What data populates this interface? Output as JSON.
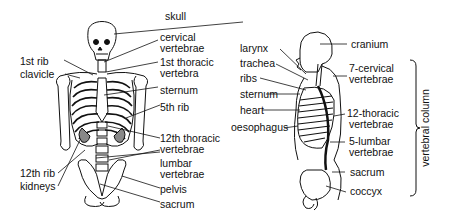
{
  "front_view": {
    "labels": {
      "skull": "skull",
      "cervical_1": "cervical",
      "cervical_2": "vertebrae",
      "first_thoracic_1": "1st thoracic",
      "first_thoracic_2": "vertebra",
      "first_rib": "1st rib",
      "clavicle": "clavicle",
      "sternum": "sternum",
      "fifth_rib": "5th rib",
      "twelfth_thoracic_1": "12th thoracic",
      "twelfth_thoracic_2": "vertebrae",
      "lumbar_1": "lumbar",
      "lumbar_2": "vertebrae",
      "twelfth_rib": "12th rib",
      "kidneys": "kidneys",
      "pelvis": "pelvis",
      "sacrum": "sacrum"
    }
  },
  "side_view": {
    "labels": {
      "cranium": "cranium",
      "larynx": "larynx",
      "trachea": "trachea",
      "ribs": "ribs",
      "sternum": "sternum",
      "heart": "heart",
      "oesophagus": "oesophagus",
      "cervical_1": "7-cervical",
      "cervical_2": "vertebrae",
      "thoracic_1": "12-thoracic",
      "thoracic_2": "vertebrae",
      "lumbar_1": "5-lumbar",
      "lumbar_2": "vertebrae",
      "sacrum": "sacrum",
      "coccyx": "coccyx"
    }
  },
  "bracket": {
    "label": "vertebral column"
  }
}
